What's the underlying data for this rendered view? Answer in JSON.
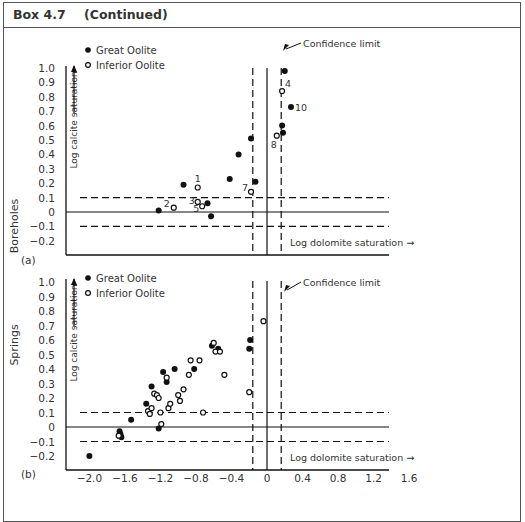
{
  "box": {
    "number": "Box 4.7",
    "subtitle": "(Continued)"
  },
  "chart_data": [
    {
      "type": "scatter",
      "panel_label": "(a)",
      "row_label": "Boreholes",
      "xlabel": "Log dolomite saturation →",
      "ylabel": "Log calcite saturation",
      "xlim": [
        -2.2,
        1.8
      ],
      "ylim": [
        -0.3,
        1.05
      ],
      "yticks": [
        "1.0",
        "0.9",
        "0.8",
        "0.7",
        "0.6",
        "0.5",
        "0.4",
        "0.3",
        "0.2",
        "0.1",
        "0",
        "-0.1",
        "-0.2"
      ],
      "legend": [
        {
          "label": "Great Oolite",
          "marker": "filled-circle"
        },
        {
          "label": "Inferior Oolite",
          "marker": "open-circle"
        }
      ],
      "annotation": "Confidence limit",
      "reference_lines": {
        "horizontal_solid": 0,
        "horizontal_dashed": [
          0.1,
          -0.1
        ],
        "vertical_solid": 0,
        "vertical_dashed": [
          -0.16,
          0.16
        ]
      },
      "series": [
        {
          "name": "Great Oolite",
          "points": [
            {
              "x": -1.22,
              "y": 0.01
            },
            {
              "x": -0.94,
              "y": 0.19
            },
            {
              "x": -0.67,
              "y": 0.06
            },
            {
              "x": -0.63,
              "y": -0.03
            },
            {
              "x": -0.42,
              "y": 0.23
            },
            {
              "x": -0.32,
              "y": 0.4
            },
            {
              "x": -0.18,
              "y": 0.51
            },
            {
              "x": -0.13,
              "y": 0.21
            },
            {
              "x": 0.2,
              "y": 0.98
            },
            {
              "x": 0.27,
              "y": 0.73,
              "label": "10"
            },
            {
              "x": 0.17,
              "y": 0.6
            },
            {
              "x": 0.18,
              "y": 0.55
            }
          ]
        },
        {
          "name": "Inferior Oolite",
          "points": [
            {
              "x": -0.78,
              "y": 0.17,
              "label": "1"
            },
            {
              "x": -1.05,
              "y": 0.03,
              "label": "2"
            },
            {
              "x": -0.78,
              "y": 0.07,
              "label": "3"
            },
            {
              "x": 0.17,
              "y": 0.84,
              "label": "4"
            },
            {
              "x": -0.73,
              "y": 0.04,
              "label": "5"
            },
            {
              "x": -0.18,
              "y": 0.14,
              "label": "7"
            },
            {
              "x": 0.11,
              "y": 0.53,
              "label": "8"
            }
          ]
        }
      ]
    },
    {
      "type": "scatter",
      "panel_label": "(b)",
      "row_label": "Springs",
      "xlabel": "Log dolomite saturation →",
      "ylabel": "Log calcite saturation",
      "xticks": [
        "-2.0",
        "-1.6",
        "-1.2",
        "-0.8",
        "-0.4",
        "0",
        "0.4",
        "0.8",
        "1.2",
        "1.6"
      ],
      "xlim": [
        -2.2,
        1.8
      ],
      "ylim": [
        -0.3,
        1.05
      ],
      "yticks": [
        "1.0",
        "0.9",
        "0.8",
        "0.7",
        "0.6",
        "0.5",
        "0.4",
        "0.3",
        "0.2",
        "0.1",
        "0",
        "-0.1",
        "-0.2"
      ],
      "legend": [
        {
          "label": "Great Oolite",
          "marker": "filled-circle"
        },
        {
          "label": "Inferior Oolite",
          "marker": "open-circle"
        }
      ],
      "annotation": "Confidence limit",
      "reference_lines": {
        "horizontal_solid": 0,
        "horizontal_dashed": [
          0.1,
          -0.1
        ],
        "vertical_solid": 0,
        "vertical_dashed": [
          -0.16,
          0.16
        ]
      },
      "series": [
        {
          "name": "Great Oolite",
          "points": [
            {
              "x": -2.0,
              "y": -0.2
            },
            {
              "x": -1.66,
              "y": -0.03
            },
            {
              "x": -1.65,
              "y": -0.05
            },
            {
              "x": -1.64,
              "y": -0.07
            },
            {
              "x": -1.53,
              "y": 0.05
            },
            {
              "x": -1.36,
              "y": 0.16
            },
            {
              "x": -1.3,
              "y": 0.28
            },
            {
              "x": -1.22,
              "y": -0.01
            },
            {
              "x": -1.17,
              "y": 0.38
            },
            {
              "x": -1.13,
              "y": 0.31
            },
            {
              "x": -1.04,
              "y": 0.4
            },
            {
              "x": -0.82,
              "y": 0.4
            },
            {
              "x": -0.62,
              "y": 0.56
            },
            {
              "x": -0.55,
              "y": 0.54
            },
            {
              "x": -0.19,
              "y": 0.6
            },
            {
              "x": -0.2,
              "y": 0.54
            }
          ]
        },
        {
          "name": "Inferior Oolite",
          "points": [
            {
              "x": -1.67,
              "y": -0.06
            },
            {
              "x": -1.34,
              "y": 0.11
            },
            {
              "x": -1.32,
              "y": 0.09
            },
            {
              "x": -1.3,
              "y": 0.13
            },
            {
              "x": -1.27,
              "y": 0.23
            },
            {
              "x": -1.24,
              "y": 0.22
            },
            {
              "x": -1.22,
              "y": 0.2
            },
            {
              "x": -1.2,
              "y": 0.1
            },
            {
              "x": -1.19,
              "y": 0.02
            },
            {
              "x": -1.13,
              "y": 0.34
            },
            {
              "x": -1.11,
              "y": 0.13
            },
            {
              "x": -1.09,
              "y": 0.16
            },
            {
              "x": -1.0,
              "y": 0.22
            },
            {
              "x": -0.98,
              "y": 0.18
            },
            {
              "x": -0.94,
              "y": 0.26
            },
            {
              "x": -0.88,
              "y": 0.36
            },
            {
              "x": -0.86,
              "y": 0.46
            },
            {
              "x": -0.76,
              "y": 0.46
            },
            {
              "x": -0.72,
              "y": 0.1
            },
            {
              "x": -0.6,
              "y": 0.58
            },
            {
              "x": -0.58,
              "y": 0.52
            },
            {
              "x": -0.53,
              "y": 0.52
            },
            {
              "x": -0.48,
              "y": 0.36
            },
            {
              "x": -0.2,
              "y": 0.24
            },
            {
              "x": -0.04,
              "y": 0.73
            }
          ]
        }
      ]
    }
  ]
}
